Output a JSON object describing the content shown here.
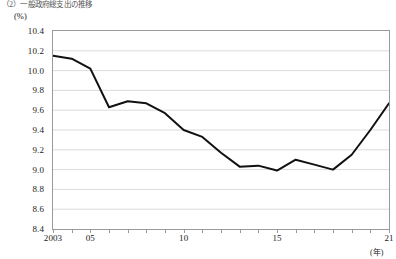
{
  "caption": "（2）一般政府総支出の推移",
  "axes": {
    "y_unit": "(%)",
    "x_unit": "(年)",
    "y_ticks": [
      "10.4",
      "10.2",
      "10.0",
      "9.8",
      "9.6",
      "9.4",
      "9.2",
      "9.0",
      "8.8",
      "8.6",
      "8.4"
    ],
    "x_ticks": [
      "2003",
      "05",
      "10",
      "15",
      "21"
    ]
  },
  "chart_data": {
    "type": "line",
    "title": "（2）一般政府総支出の推移",
    "xlabel": "(年)",
    "ylabel": "(%)",
    "ylim": [
      8.4,
      10.4
    ],
    "xlim": [
      2003,
      2021
    ],
    "grid": true,
    "legend": "none",
    "line_color": "#111111",
    "x": [
      2003,
      2004,
      2005,
      2006,
      2007,
      2008,
      2009,
      2010,
      2011,
      2012,
      2013,
      2014,
      2015,
      2016,
      2017,
      2018,
      2019,
      2020,
      2021
    ],
    "values": [
      10.15,
      10.12,
      10.02,
      9.63,
      9.69,
      9.67,
      9.57,
      9.4,
      9.33,
      9.17,
      9.03,
      9.04,
      8.99,
      9.1,
      9.05,
      9.0,
      9.15,
      9.4,
      9.67
    ],
    "categories": [
      "2003",
      "2004",
      "2005",
      "2006",
      "2007",
      "2008",
      "2009",
      "2010",
      "2011",
      "2012",
      "2013",
      "2014",
      "2015",
      "2016",
      "2017",
      "2018",
      "2019",
      "2020",
      "2021"
    ]
  }
}
